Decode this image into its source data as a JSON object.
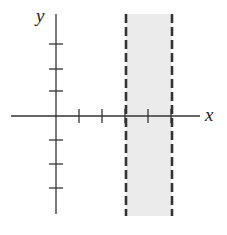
{
  "diagram": {
    "axes": {
      "x_label": "x",
      "y_label": "y",
      "x_ticks": [
        1,
        2,
        3,
        4,
        5
      ],
      "y_ticks": [
        -3,
        -2,
        -1,
        1,
        2,
        3
      ]
    },
    "region": {
      "x_min": 3,
      "x_max": 5,
      "boundary_style": "dashed",
      "fill_color": "#ebebeb",
      "line_color": "#333333"
    }
  }
}
